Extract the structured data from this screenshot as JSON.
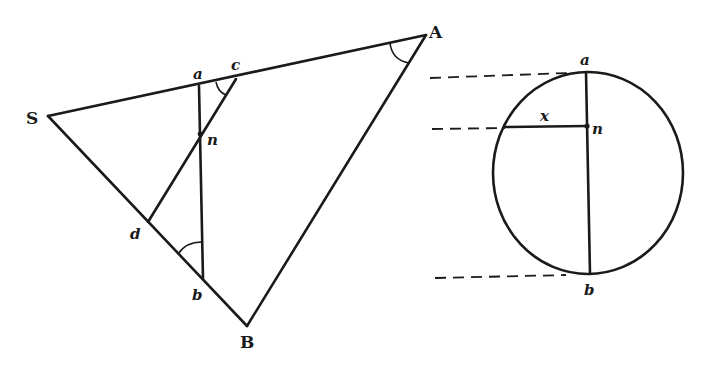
{
  "figure": {
    "triangle": {
      "vertices": {
        "S": {
          "label": "S",
          "x": 48,
          "y": 116
        },
        "A": {
          "label": "A",
          "x": 426,
          "y": 35
        },
        "B": {
          "label": "B",
          "x": 247,
          "y": 326
        }
      },
      "points": {
        "a": {
          "label": "a",
          "x": 199,
          "y": 86
        },
        "c": {
          "label": "c",
          "x": 236,
          "y": 79
        },
        "n": {
          "label": "n",
          "x": 200,
          "y": 134
        },
        "d": {
          "label": "d",
          "x": 148,
          "y": 222
        },
        "b": {
          "label": "b",
          "x": 203,
          "y": 279
        }
      },
      "segments": [
        "SA",
        "SB",
        "AB",
        "ab",
        "cd"
      ],
      "angle_marks": [
        "angle at A",
        "angle at c (between ca and cd)",
        "angle at b (between ba and bS)"
      ]
    },
    "circle": {
      "center": {
        "x": 588,
        "y": 173
      },
      "rx": 95,
      "ry": 101,
      "points": {
        "a": {
          "label": "a",
          "x": 586,
          "y": 72
        },
        "n": {
          "label": "n",
          "x": 587,
          "y": 126
        },
        "b": {
          "label": "b",
          "x": 590,
          "y": 274
        }
      },
      "chord_label": "x",
      "chord_left": {
        "x": 505,
        "y": 127
      }
    },
    "projection_lines": [
      {
        "from_x": 430,
        "to_x": 565,
        "y": 78,
        "target": "a"
      },
      {
        "from_x": 432,
        "to_x": 505,
        "y": 129,
        "target": "n"
      },
      {
        "from_x": 435,
        "to_x": 565,
        "y": 278,
        "target": "b"
      }
    ]
  }
}
